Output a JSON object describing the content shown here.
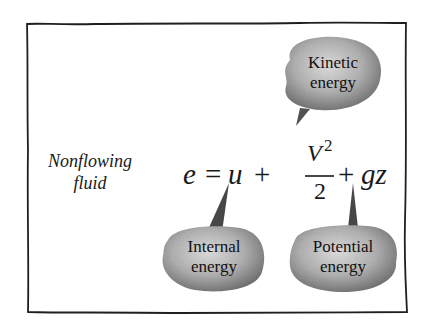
{
  "diagram": {
    "context_label": {
      "line1": "Nonflowing",
      "line2": "fluid"
    },
    "equation": {
      "lhs": "e",
      "equals": "=",
      "term1": "u",
      "plus1": "+",
      "term2_numerator": "V",
      "term2_exponent": "2",
      "term2_denominator": "2",
      "plus2": "+",
      "term3": "gz",
      "full_text": "e = u + V^2/2 + gz"
    },
    "callouts": [
      {
        "id": "kinetic",
        "line1": "Kinetic",
        "line2": "energy",
        "points_to": "V^2/2"
      },
      {
        "id": "internal",
        "line1": "Internal",
        "line2": "energy",
        "points_to": "u"
      },
      {
        "id": "potential",
        "line1": "Potential",
        "line2": "energy",
        "points_to": "gz"
      }
    ],
    "colors": {
      "background": "#ffffff",
      "ink": "#1a1a1a",
      "bubble_dark": "#7a7a7a",
      "bubble_light": "#d4d4d4"
    }
  }
}
